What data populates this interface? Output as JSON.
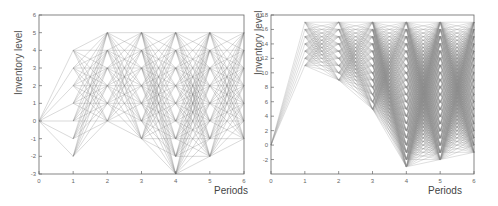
{
  "chart_data": [
    {
      "type": "line",
      "title": "",
      "xlabel": "Periods",
      "ylabel": "Inventory level",
      "x_ticks": [
        0,
        1,
        2,
        3,
        4,
        5,
        6
      ],
      "y_ticks": [
        -3,
        -2,
        -1,
        0,
        1,
        2,
        3,
        4,
        5,
        6
      ],
      "xlim": [
        0,
        6
      ],
      "ylim": [
        -3,
        6
      ],
      "grid": false,
      "description": "Scenario tree of inventory trajectories; each period node connects to many levels of next period",
      "node_levels": {
        "0": [
          0
        ],
        "1": [
          -2,
          -1,
          0,
          1,
          2,
          3,
          4
        ],
        "2": [
          0,
          1,
          2,
          3,
          4,
          5
        ],
        "3": [
          -1,
          0,
          1,
          2,
          3,
          4,
          5
        ],
        "4": [
          -3,
          -2,
          -1,
          0,
          1,
          2,
          3,
          4,
          5
        ],
        "5": [
          -2,
          -1,
          0,
          1,
          2,
          3,
          4,
          5
        ],
        "6": [
          -1,
          0,
          1,
          2,
          3,
          4,
          5
        ]
      },
      "line_color": "#7a7a7a"
    },
    {
      "type": "line",
      "title": "",
      "xlabel": "Periods",
      "ylabel": "Inventory level",
      "x_ticks": [
        0,
        1,
        2,
        3,
        4,
        5,
        6
      ],
      "y_ticks": [
        -2,
        0,
        2,
        4,
        6,
        8,
        10,
        12,
        14,
        16,
        18
      ],
      "xlim": [
        0,
        6
      ],
      "ylim": [
        -4,
        18
      ],
      "grid": false,
      "description": "Scenario tree of inventory trajectories with higher order-up-to levels",
      "node_levels": {
        "0": [
          0
        ],
        "1": [
          11,
          12,
          13,
          14,
          15,
          16,
          17
        ],
        "2": [
          9,
          10,
          11,
          12,
          13,
          14,
          15,
          16,
          17
        ],
        "3": [
          5,
          6,
          7,
          8,
          9,
          10,
          11,
          12,
          13,
          14,
          15,
          16,
          17
        ],
        "4": [
          -3,
          -2,
          -1,
          0,
          1,
          2,
          3,
          4,
          5,
          6,
          7,
          8,
          9,
          10,
          11,
          12,
          13,
          14,
          15,
          16,
          17
        ],
        "5": [
          -2,
          -1,
          0,
          1,
          2,
          3,
          4,
          5,
          6,
          7,
          8,
          9,
          10,
          11,
          12,
          13,
          14,
          15,
          16,
          17
        ],
        "6": [
          -1,
          0,
          1,
          2,
          3,
          4,
          5,
          6,
          7,
          8,
          9,
          10,
          11,
          12,
          13,
          14,
          15,
          16,
          17
        ]
      },
      "line_color": "#8a8a8a"
    }
  ],
  "left": {
    "ylabel": "Inventory level",
    "xlabel": "Periods"
  },
  "right": {
    "ylabel": "Inventory level",
    "xlabel": "Periods"
  }
}
